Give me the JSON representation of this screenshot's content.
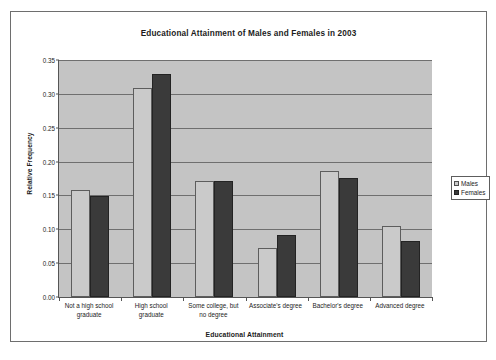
{
  "chart_data": {
    "type": "bar",
    "title": "Educational Attainment of Males and Females in 2003",
    "xlabel": "Educational Attainment",
    "ylabel": "Relative Frequency",
    "categories": [
      "Not a high school graduate",
      "High school graduate",
      "Some college, but no degree",
      "Associate's degree",
      "Bachelor's degree",
      "Advanced degree"
    ],
    "category_label_lines": [
      [
        "Not a high school",
        "graduate"
      ],
      [
        "High school",
        "graduate"
      ],
      [
        "Some college, but",
        "no degree"
      ],
      [
        "Associate's degree"
      ],
      [
        "Bachelor's degree"
      ],
      [
        "Advanced degree"
      ]
    ],
    "series": [
      {
        "name": "Males",
        "color": "#cacaca",
        "values": [
          0.158,
          0.308,
          0.172,
          0.073,
          0.186,
          0.105
        ]
      },
      {
        "name": "Females",
        "color": "#3a3a3a",
        "values": [
          0.149,
          0.33,
          0.172,
          0.092,
          0.176,
          0.082
        ]
      }
    ],
    "ylim": [
      0.0,
      0.35
    ],
    "yticks": [
      0.0,
      0.05,
      0.1,
      0.15,
      0.2,
      0.25,
      0.3,
      0.35
    ],
    "ytick_labels": [
      "0.00",
      "0.05",
      "0.10",
      "0.15",
      "0.20",
      "0.25",
      "0.30",
      "0.35"
    ],
    "grid": true,
    "legend_position": "right",
    "plot_background": "#c4c4c4"
  },
  "legend": {
    "items": [
      {
        "label": "Males",
        "swatch": "males"
      },
      {
        "label": "Females",
        "swatch": "females"
      }
    ]
  }
}
